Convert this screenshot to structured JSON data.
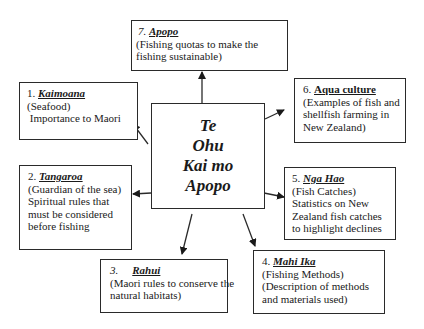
{
  "center": {
    "lines": [
      "Te",
      "Ohu",
      "Kai mo",
      "Apopo"
    ]
  },
  "boxes": {
    "kaimoana": {
      "number": "1.",
      "name": "Kaimoana",
      "lines": [
        "(Seafood)",
        " Importance to Maori"
      ]
    },
    "tangaroa": {
      "number": "2.",
      "name": "Tangaroa",
      "lines": [
        "(Guardian of the sea)",
        "Spiritual rules that",
        "must be considered",
        "before fishing"
      ]
    },
    "rahui": {
      "number": "3.",
      "name": "Rahui",
      "lines": [
        "(Maori rules to conserve the",
        "natural habitats)"
      ]
    },
    "mahi_ika": {
      "number": "4.",
      "name": "Mahi Ika",
      "lines": [
        "(Fishing Methods)",
        "(Description of methods",
        "and materials used)"
      ]
    },
    "nga_hao": {
      "number": "5.",
      "name": "Nga Hao",
      "lines": [
        "(Fish Catches)",
        "Statistics on New",
        "Zealand fish catches",
        "to highlight declines"
      ]
    },
    "aqua_culture": {
      "number": "6.",
      "name": "Aqua culture",
      "lines": [
        "(Examples of fish and",
        "shellfish farming in",
        "New Zealand)"
      ]
    },
    "apopo": {
      "number": "7.",
      "name": "Apopo",
      "lines": [
        "(Fishing quotas to make the",
        "fishing sustainable)"
      ]
    }
  },
  "colors": {
    "line": "#2a2a2a",
    "background": "#ffffff",
    "text": "#1a1a1a"
  }
}
